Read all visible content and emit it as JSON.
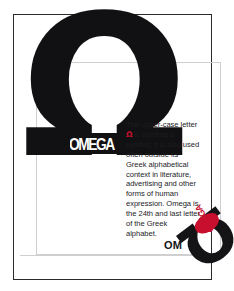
{
  "poster": {
    "headline_glyph": "Ω",
    "chip_label": "OMEGA",
    "body_text_lead": "The upper-case letter ",
    "body_symbol": "Ω",
    "body_text_rest": " is used as a symbol; it is also used often outside its Greek alphabetical context in literature, advertising and other forms of human expression. Omega is the 24th and last letter of the Greek alphabet.",
    "mark": {
      "wordmark": "OM",
      "rotated_glyph": "Ω",
      "red_label": "OMEGA"
    },
    "colors": {
      "ink": "#141416",
      "accent_red": "#c8102e",
      "frame": "#2b2b2e",
      "rule": "#cfcfd2",
      "paper": "#ffffff"
    }
  }
}
